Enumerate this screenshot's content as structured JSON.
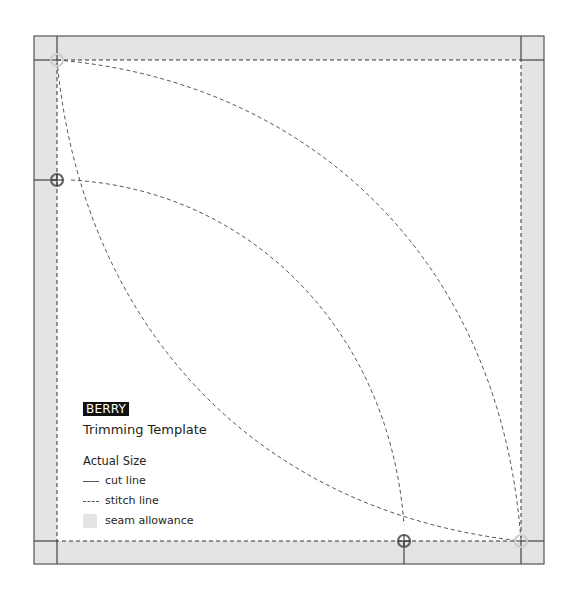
{
  "template": {
    "badge": "BERRY",
    "title": "Trimming Template",
    "scale_label": "Actual Size"
  },
  "legend": {
    "items": [
      {
        "key": "cut",
        "label": "cut line"
      },
      {
        "key": "stitch",
        "label": "stitch line"
      },
      {
        "key": "seam",
        "label": "seam allowance"
      }
    ]
  },
  "colors": {
    "seam_allowance": "#e4e4e4",
    "line": "#444444",
    "badge_bg": "#111111",
    "badge_text": "#ffffff"
  }
}
